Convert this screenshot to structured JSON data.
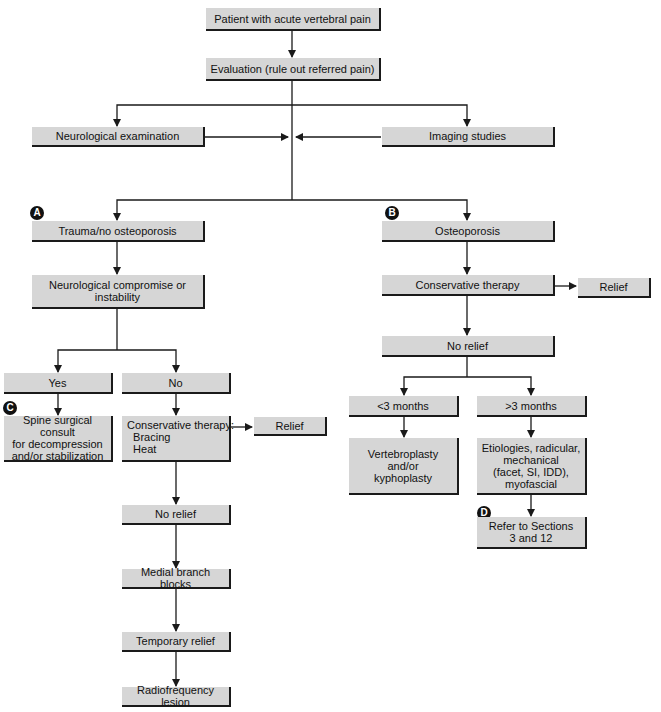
{
  "diagram": {
    "nodes": {
      "start": "Patient with acute vertebral pain",
      "evaluation": "Evaluation (rule out referred pain)",
      "neuro_exam": "Neurological examination",
      "imaging": "Imaging studies",
      "trauma": "Trauma/no osteoporosis",
      "osteoporosis": "Osteoporosis",
      "neuro_compromise": "Neurological compromise or\ninstability",
      "yes": "Yes",
      "no": "No",
      "spine_consult": "Spine surgical consult\nfor decompression\nand/or stabilization",
      "cons_therapy_a": "Conservative therapy:\n  Bracing\n  Heat",
      "relief_a": "Relief",
      "no_relief_a": "No relief",
      "medial_branch": "Medial branch blocks",
      "temp_relief": "Temporary relief",
      "rf_lesion": "Radiofrequency lesion",
      "cons_therapy_b": "Conservative therapy",
      "relief_b": "Relief",
      "no_relief_b": "No relief",
      "lt3": "<3 months",
      "gt3": ">3 months",
      "vertebroplasty": "Vertebroplasty\nand/or\nkyphoplasty",
      "etiologies": "Etiologies, radicular,\nmechanical\n(facet, SI, IDD),\nmyofascial",
      "refer": "Refer to Sections\n3 and 12"
    },
    "badges": {
      "a": "A",
      "b": "B",
      "c": "C",
      "d": "D"
    },
    "colors": {
      "box_fill": "#d6d6d6",
      "box_shadow": "#1a1a1a",
      "line": "#1a1a1a",
      "badge": "#111111"
    }
  }
}
